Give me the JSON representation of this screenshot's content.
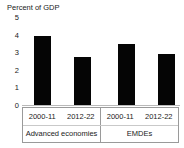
{
  "chart_data": {
    "type": "bar",
    "title": "Percent of GDP",
    "xlabel": "",
    "ylabel": "",
    "ylim": [
      0,
      5
    ],
    "yticks": [
      "5",
      "4",
      "3",
      "2",
      "1",
      "0"
    ],
    "grid": false,
    "legend": "none",
    "bar_color": "#050505",
    "axis_color": "#9a9a9a",
    "categories": [
      "2000-11",
      "2012-22",
      "2000-11",
      "2012-22"
    ],
    "values": [
      3.9,
      2.75,
      3.45,
      2.9
    ],
    "groups": [
      {
        "label": "Advanced economies",
        "categories": [
          "2000-11",
          "2012-22"
        ],
        "values": [
          3.9,
          2.75
        ]
      },
      {
        "label": "EMDEs",
        "categories": [
          "2000-11",
          "2012-22"
        ],
        "values": [
          3.45,
          2.9
        ]
      }
    ]
  },
  "bars": [
    {
      "name": "bar-ae-2000-11",
      "label": "2000-11",
      "value": 3.9
    },
    {
      "name": "bar-ae-2012-22",
      "label": "2012-22",
      "value": 2.75
    },
    {
      "name": "bar-emde-2000-11",
      "label": "2000-11",
      "value": 3.45
    },
    {
      "name": "bar-emde-2012-22",
      "label": "2012-22",
      "value": 2.9
    }
  ],
  "axis": {
    "ticks": [
      "5",
      "4",
      "3",
      "2",
      "1",
      "0"
    ]
  },
  "labels": {
    "periods": [
      "2000-11",
      "2012-22",
      "2000-11",
      "2012-22"
    ],
    "groups": [
      "Advanced economies",
      "EMDEs"
    ]
  }
}
